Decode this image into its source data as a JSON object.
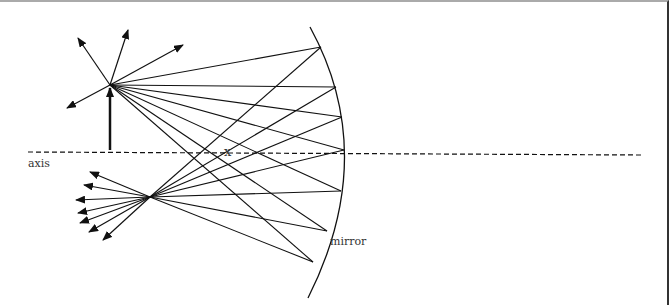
{
  "diagram": {
    "labels": {
      "axis": "axis",
      "mirror": "mirror",
      "focus_mark": "x"
    },
    "colors": {
      "line": "#111111",
      "background": "#ffffff"
    },
    "object": {
      "base": [
        110,
        152
      ],
      "tip": [
        110,
        85
      ]
    },
    "image_point": [
      150,
      197
    ],
    "mirror_points": [
      [
        321,
        47
      ],
      [
        336,
        87
      ],
      [
        342,
        117
      ],
      [
        344,
        150
      ],
      [
        341,
        191
      ],
      [
        327,
        231
      ],
      [
        313,
        262
      ]
    ]
  }
}
